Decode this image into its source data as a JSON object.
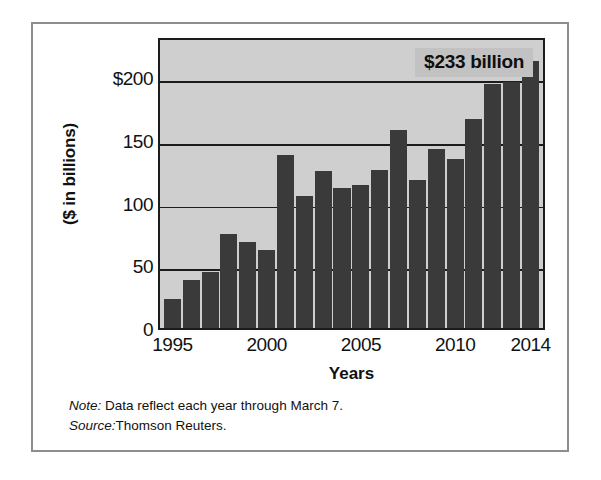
{
  "chart_data": {
    "type": "bar",
    "title": "",
    "xlabel": "Years",
    "ylabel": "($ in billions)",
    "categories": [
      "1995",
      "1996",
      "1997",
      "1998",
      "1999",
      "2000",
      "2001",
      "2002",
      "2003",
      "2004",
      "2005",
      "2006",
      "2007",
      "2008",
      "2009",
      "2010",
      "2011",
      "2012",
      "2013",
      "2014"
    ],
    "values": [
      23,
      38,
      45,
      75,
      69,
      62,
      138,
      105,
      125,
      112,
      114,
      126,
      158,
      118,
      143,
      135,
      167,
      195,
      196,
      213
    ],
    "ylim": [
      0,
      233
    ],
    "yticks": [
      {
        "value": 0,
        "label": "0"
      },
      {
        "value": 50,
        "label": "50"
      },
      {
        "value": 100,
        "label": "100"
      },
      {
        "value": 150,
        "label": "150"
      },
      {
        "value": 200,
        "label": "$200"
      }
    ],
    "xticks": [
      {
        "value": "1995",
        "label": "1995"
      },
      {
        "value": "2000",
        "label": "2000"
      },
      {
        "value": "2005",
        "label": "2005"
      },
      {
        "value": "2010",
        "label": "2010"
      },
      {
        "value": "2014",
        "label": "2014"
      }
    ],
    "grid": true,
    "legend": "none",
    "annotations": [
      {
        "text": "$233 billion",
        "position": "top-right"
      }
    ],
    "bar_color": "#3a3a3a",
    "plot_background": "#cfcfcf"
  },
  "annotation": {
    "callout_text": "$233 billion"
  },
  "axes": {
    "y_title": "($ in billions)",
    "x_title": "Years"
  },
  "footnotes": [
    {
      "lead": "Note:",
      "text": " Data reflect each year through March 7."
    },
    {
      "lead": "Source:",
      "text": "Thomson Reuters."
    }
  ]
}
